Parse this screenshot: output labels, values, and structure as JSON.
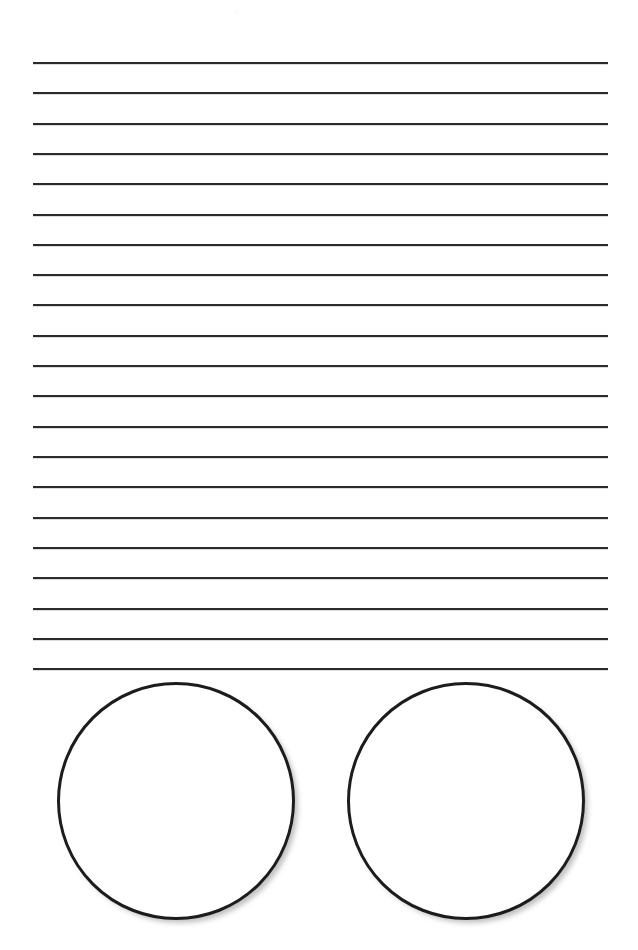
{
  "page": {
    "background_color": "#ffffff",
    "width": 638,
    "height": 950
  },
  "writing_lines": {
    "name": "ruled-writing-lines",
    "count": 21,
    "line_color": "#2b2b2b",
    "line_thickness_px": 2,
    "left_x": 33,
    "right_x": 608,
    "length_px": 575,
    "first_line_y": 62,
    "spacing_px": 30.3,
    "last_line_y": 668,
    "y_positions": [
      62,
      92,
      123,
      153,
      183,
      214,
      244,
      274,
      304,
      335,
      365,
      395,
      426,
      456,
      486,
      517,
      547,
      577,
      608,
      638,
      668
    ]
  },
  "answer_circles": {
    "name": "answer-circles",
    "count": 2,
    "stroke_color": "#1c1c1c",
    "fill_color": "#ffffff",
    "stroke_width_px": 3,
    "shadow_color": "#787878",
    "items": [
      {
        "label": "left-circle",
        "center_x": 176,
        "center_y": 801,
        "diameter_px": 238,
        "left": 57,
        "top": 682
      },
      {
        "label": "right-circle",
        "center_x": 466,
        "center_y": 801,
        "diameter_px": 238,
        "left": 347,
        "top": 682
      }
    ]
  },
  "artifacts": {
    "speck": {
      "label": "scan-speck",
      "x": 234,
      "y": 9,
      "size_px": 5,
      "color": "#fbfbfb"
    }
  }
}
